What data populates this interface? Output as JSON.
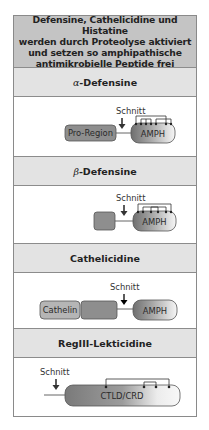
{
  "header": {
    "lines": [
      "Defensine, Cathelicidine und Histatine",
      "werden durch Proteolyse aktiviert",
      "und setzen so amphipathische",
      "antimikrobielle Peptide frei"
    ]
  },
  "sections": [
    {
      "greek": "α",
      "title_rest": "-Defensine",
      "cut_label": "Schnitt",
      "boxes": [
        "Pro-Region",
        "AMPH"
      ]
    },
    {
      "greek": "β",
      "title_rest": "-Defensine",
      "cut_label": "Schnitt",
      "boxes": [
        "",
        "AMPH"
      ]
    },
    {
      "greek": "",
      "title_rest": "Cathelicidine",
      "cut_label": "Schnitt",
      "boxes": [
        "Cathelin",
        "",
        "AMPH"
      ]
    },
    {
      "greek": "",
      "title_rest": "RegIII-Lekticidine",
      "cut_label": "Schnitt",
      "boxes": [
        "CTLD/CRD"
      ]
    }
  ],
  "colors": {
    "header_bg": "#c4c4c4",
    "band_bg": "#e3e3e3",
    "pro_region": "#8e8e8e",
    "cathelin": "#b5b5b5",
    "amph_dark": "#7a7a7a",
    "amph_light": "#f4f4f4",
    "border": "#8a8a8a"
  }
}
